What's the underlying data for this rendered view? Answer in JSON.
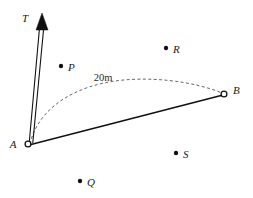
{
  "figure": {
    "background_color": "#ffffff",
    "ink_color": "#111111",
    "arc_color": "#555555",
    "width": 253,
    "height": 198
  },
  "labels": {
    "T": "T",
    "A": "A",
    "B": "B",
    "P": "P",
    "Q": "Q",
    "R": "R",
    "S": "S",
    "distance": "20m"
  },
  "nodes": [
    {
      "id": "A",
      "label": "A",
      "kind": "open-circle",
      "x": 28,
      "y": 144,
      "label_x": 13,
      "label_y": 148
    },
    {
      "id": "B",
      "label": "B",
      "kind": "open-circle",
      "x": 224,
      "y": 94,
      "label_x": 233,
      "label_y": 94
    }
  ],
  "points": [
    {
      "id": "P",
      "label": "P",
      "kind": "filled-dot",
      "x": 61,
      "y": 66,
      "label_x": 68,
      "label_y": 71
    },
    {
      "id": "Q",
      "label": "Q",
      "kind": "filled-dot",
      "x": 80,
      "y": 181,
      "label_x": 87,
      "label_y": 186
    },
    {
      "id": "R",
      "label": "R",
      "kind": "filled-dot",
      "x": 166,
      "y": 48,
      "label_x": 173,
      "label_y": 53
    },
    {
      "id": "S",
      "label": "S",
      "kind": "filled-dot",
      "x": 176,
      "y": 153,
      "label_x": 183,
      "label_y": 158
    }
  ],
  "segments": [
    {
      "id": "AB",
      "from": "A",
      "to": "B",
      "style": "solid",
      "x1": 29,
      "y1": 145,
      "x2": 223,
      "y2": 95
    }
  ],
  "arcs": [
    {
      "id": "arc-AB",
      "from": "A",
      "to": "B",
      "style": "dashed",
      "measure": "20m",
      "path": "M 30 144 C 36 116, 62 92, 104 83 C 146 74, 196 82, 222 93"
    }
  ],
  "arrow": {
    "id": "T",
    "label": "T",
    "tail_x": 31,
    "tail_y": 143,
    "tip_x": 42,
    "tip_y": 14,
    "head_points": "42,13 36,30 48,30",
    "shaft_left": "M 29.2 143 L 39.4 29",
    "shaft_right": "M 32.8 143 L 43.6 29",
    "label_x": 28,
    "label_y": 22
  }
}
